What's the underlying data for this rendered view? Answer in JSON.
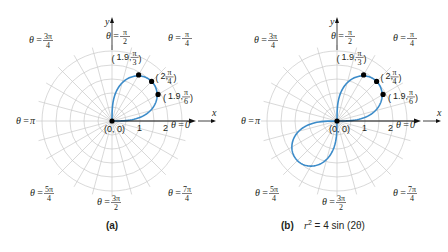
{
  "figure": {
    "colors": {
      "curve": "#3b8bc9",
      "grid": "#c9c9c9",
      "axis": "#111111",
      "point": "#000000",
      "text": "#231f20"
    },
    "panels": [
      {
        "id": "a",
        "caption": "(a)",
        "equation": "",
        "center": [
          112,
          121
        ],
        "show_third_quadrant_lobe": false
      },
      {
        "id": "b",
        "caption": "(b)",
        "equation_lhs": "r",
        "equation_exp": "2",
        "equation_rhs": " = 4 sin (2θ)",
        "center": [
          337,
          121
        ],
        "show_third_quadrant_lobe": true
      }
    ],
    "angle_labels": [
      {
        "name": "theta-0",
        "prefix": "θ = ",
        "num": "0",
        "den": ""
      },
      {
        "name": "theta-pi-4",
        "prefix": "θ = ",
        "num": "π",
        "den": "4"
      },
      {
        "name": "theta-pi-2",
        "prefix": "θ = ",
        "num": "π",
        "den": "2"
      },
      {
        "name": "theta-3pi-4",
        "prefix": "θ = ",
        "num": "3π",
        "den": "4"
      },
      {
        "name": "theta-pi",
        "prefix": "θ = ",
        "num": "π",
        "den": ""
      },
      {
        "name": "theta-5pi-4",
        "prefix": "θ = ",
        "num": "5π",
        "den": "4"
      },
      {
        "name": "theta-3pi-2",
        "prefix": "θ = ",
        "num": "3π",
        "den": "2"
      },
      {
        "name": "theta-7pi-4",
        "prefix": "θ = ",
        "num": "7π",
        "den": "4"
      }
    ],
    "axis_labels": {
      "x": "x",
      "y": "y",
      "tick1": "1",
      "tick2": "2",
      "origin": "(0, 0)"
    },
    "points": [
      {
        "r_label": "1.9",
        "num": "π",
        "den": "3"
      },
      {
        "r_label": "2",
        "num": "π",
        "den": "4"
      },
      {
        "r_label": "1.9",
        "num": "π",
        "den": "6"
      }
    ]
  },
  "chart_data": [
    {
      "type": "line",
      "subtype": "polar",
      "title": "(a)",
      "equation": "r^2 = 4 sin(2θ), 0 ≤ θ ≤ π/2",
      "grid": {
        "rings": [
          0.5,
          1,
          1.5,
          2,
          2.5
        ],
        "radial_step_deg": 15
      },
      "tick_labels": [
        "1",
        "2"
      ],
      "angle_labels": [
        "θ = 0",
        "θ = π/4",
        "θ = π/2",
        "θ = 3π/4",
        "θ = π",
        "θ = 5π/4",
        "θ = 3π/2",
        "θ = 7π/4"
      ],
      "points": [
        {
          "label": "(0, 0)",
          "r": 0,
          "theta": "0"
        },
        {
          "label": "(1.9, π/6)",
          "r": 1.9,
          "theta": "π/6"
        },
        {
          "label": "(2, π/4)",
          "r": 2,
          "theta": "π/4"
        },
        {
          "label": "(1.9, π/3)",
          "r": 1.9,
          "theta": "π/3"
        }
      ],
      "xlabel": "x",
      "ylabel": "y",
      "rlim": [
        0,
        2.5
      ]
    },
    {
      "type": "line",
      "subtype": "polar",
      "title": "(b) r^2 = 4 sin (2θ)",
      "equation": "r^2 = 4 sin(2θ) (lemniscate, lobes in quadrants I and III)",
      "grid": {
        "rings": [
          0.5,
          1,
          1.5,
          2,
          2.5
        ],
        "radial_step_deg": 15
      },
      "tick_labels": [
        "1",
        "2"
      ],
      "angle_labels": [
        "θ = 0",
        "θ = π/4",
        "θ = π/2",
        "θ = 3π/4",
        "θ = π",
        "θ = 5π/4",
        "θ = 3π/2",
        "θ = 7π/4"
      ],
      "points": [
        {
          "label": "(0, 0)",
          "r": 0,
          "theta": "0"
        },
        {
          "label": "(1.9, π/6)",
          "r": 1.9,
          "theta": "π/6"
        },
        {
          "label": "(2, π/4)",
          "r": 2,
          "theta": "π/4"
        },
        {
          "label": "(1.9, π/3)",
          "r": 1.9,
          "theta": "π/3"
        }
      ],
      "xlabel": "x",
      "ylabel": "y",
      "rlim": [
        0,
        2.5
      ]
    }
  ]
}
